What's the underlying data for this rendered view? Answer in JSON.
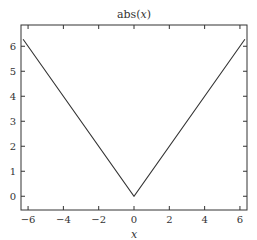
{
  "chart_data": {
    "type": "line",
    "title": "abs(x)",
    "xlabel": "x",
    "ylabel": "",
    "xlim": [
      -6.4,
      6.4
    ],
    "ylim": [
      -0.55,
      6.85
    ],
    "xticks": [
      -6,
      -4,
      -2,
      0,
      2,
      4,
      6
    ],
    "yticks": [
      0,
      1,
      2,
      3,
      4,
      5,
      6
    ],
    "xtick_labels": [
      "−6",
      "−4",
      "−2",
      "0",
      "2",
      "4",
      "6"
    ],
    "ytick_labels": [
      "0",
      "1",
      "2",
      "3",
      "4",
      "5",
      "6"
    ],
    "grid": false,
    "legend": null,
    "series": [
      {
        "name": "abs(x)",
        "color": "#333333",
        "x": [
          -6.283,
          0,
          6.283
        ],
        "y": [
          6.283,
          0,
          6.283
        ]
      }
    ]
  }
}
